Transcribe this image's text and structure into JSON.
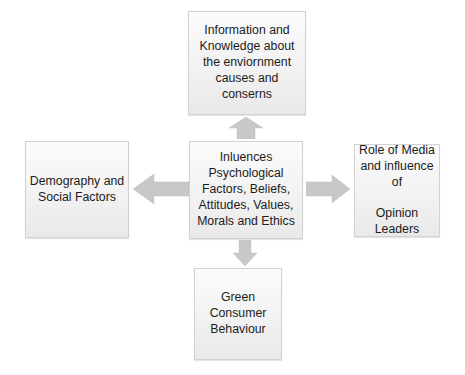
{
  "diagram": {
    "type": "flow-diagram",
    "background_color": "#ffffff",
    "node_fill_color": "#f1f1f1",
    "node_border_color": "#d2d2d2",
    "arrow_color": "#c4c4c4",
    "text_color": "#1c1c1c",
    "nodes": {
      "top": {
        "id": "information-knowledge",
        "text": "Information  and\nKnowledge about\nthe enviornment\ncauses and conserns"
      },
      "center": {
        "id": "influences",
        "text": "Inluences\nPsychological\nFactors, Beliefs,\nAttitudes, Values,\nMorals and Ethics"
      },
      "left": {
        "id": "demography-social-factors",
        "text": "Demography and\nSocial Factors"
      },
      "right": {
        "id": "role-of-media",
        "text": "Role of Media\nand influence\nof\n\nOpinion\nLeaders"
      },
      "bottom": {
        "id": "green-consumer-behaviour",
        "text": "Green\nConsumer\nBehaviour"
      }
    },
    "arrows": [
      {
        "id": "center-to-top",
        "direction": "up",
        "from": "influences",
        "to": "information-knowledge"
      },
      {
        "id": "center-to-left",
        "direction": "left",
        "from": "influences",
        "to": "demography-social-factors"
      },
      {
        "id": "center-to-right",
        "direction": "right",
        "from": "influences",
        "to": "role-of-media"
      },
      {
        "id": "center-to-bottom",
        "direction": "down",
        "from": "influences",
        "to": "green-consumer-behaviour"
      }
    ]
  }
}
